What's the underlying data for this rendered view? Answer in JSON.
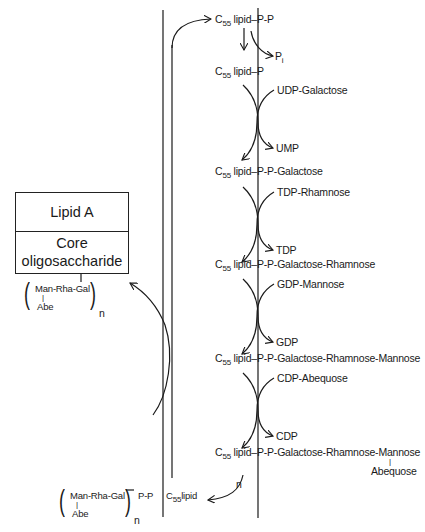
{
  "figure": {
    "type": "biosynthesis pathway diagram",
    "box": {
      "top_label": "Lipid A",
      "bottom_label_line1": "Core",
      "bottom_label_line2": "oligosaccharide"
    },
    "attached_repeat": {
      "chain": "Man-Rha-Gal",
      "branch_bar": "|",
      "branch": "Abe",
      "subscript": "n"
    },
    "top": {
      "carrier": "C",
      "carrier_sub": "55",
      "carrier_rest": " lipid",
      "tail": "P-P",
      "released": "P",
      "released_sub": "i"
    },
    "steps": [
      {
        "intermediate_prefix": "C",
        "intermediate_sub": "55",
        "intermediate_lipid": " lipid",
        "intermediate_tail": "P",
        "donor": "UDP-Galactose",
        "product": "UMP"
      },
      {
        "intermediate_prefix": "C",
        "intermediate_sub": "55",
        "intermediate_lipid": " lipid",
        "intermediate_tail": "P-P-Galactose",
        "donor": "TDP-Rhamnose",
        "product": "TDP"
      },
      {
        "intermediate_prefix": "C",
        "intermediate_sub": "55",
        "intermediate_lipid": " lipid",
        "intermediate_tail": "P-P-Galactose-Rhamnose",
        "donor": "GDP-Mannose",
        "product": "GDP"
      },
      {
        "intermediate_prefix": "C",
        "intermediate_sub": "55",
        "intermediate_lipid": " lipid",
        "intermediate_tail": "P-P-Galactose-Rhamnose-Mannose",
        "donor": "CDP-Abequose",
        "product": "CDP"
      }
    ],
    "final": {
      "prefix": "C",
      "sub": "55",
      "lipid": " lipid",
      "tail": "P-P-Galactose-Rhamnose-Mannose",
      "branch_bar": "|",
      "branch": "Abequose",
      "repeat_label": "n"
    },
    "polymer": {
      "chain": "Man-Rha-Gal",
      "branch_bar": "|",
      "branch": "Abe",
      "subscript": "n",
      "link": "P-P",
      "carrier": "C",
      "carrier_sub": "55",
      "carrier_rest": "lipid"
    },
    "colors": {
      "ink": "#1a1a1a",
      "background": "#ffffff"
    }
  }
}
